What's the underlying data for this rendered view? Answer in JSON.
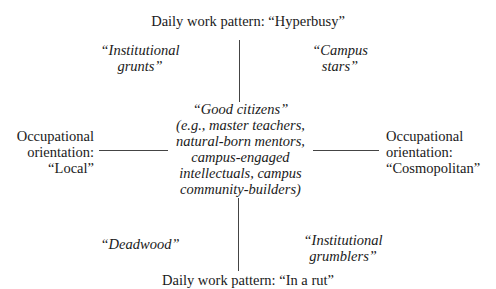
{
  "axes": {
    "top": "Daily work pattern: “Hyperbusy”",
    "bottom": "Daily work pattern: “In a rut”",
    "left": [
      "Occupational",
      "orientation:",
      "“Local”"
    ],
    "right": [
      "Occupational",
      "orientation:",
      "“Cosmopolitan”"
    ]
  },
  "quadrants": {
    "top_left": [
      "“Institutional",
      "grunts”"
    ],
    "top_right": [
      "“Campus",
      "stars”"
    ],
    "bottom_left": [
      "“Deadwood”"
    ],
    "bottom_right": [
      "“Institutional",
      "grumblers”"
    ]
  },
  "center": [
    "“Good citizens”",
    "(e.g., master teachers,",
    "natural-born mentors,",
    "campus-engaged",
    "intellectuals, campus",
    "community-builders)"
  ]
}
